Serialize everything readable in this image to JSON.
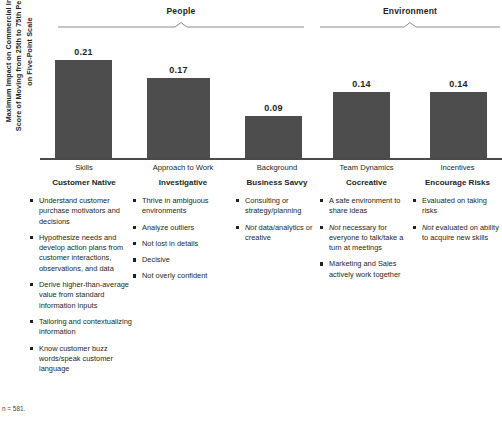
{
  "groups": [
    {
      "label": "People"
    },
    {
      "label": "Environment"
    }
  ],
  "axis": {
    "y_label": "Maximum Impact on Commercial Insight Score of Moving from 25th to 75th Percentile, on Five-Point Scale"
  },
  "chart_data": {
    "type": "bar",
    "title": "",
    "xlabel": "",
    "ylabel": "Maximum Impact on Commercial Insight Score of Moving from 25th to 75th Percentile, on Five-Point Scale",
    "categories": [
      "Skills",
      "Approach to Work",
      "Background",
      "Team Dynamics",
      "Incentives"
    ],
    "values": [
      0.21,
      0.17,
      0.09,
      0.14,
      0.14
    ],
    "value_labels": [
      "0.21",
      "0.17",
      "0.09",
      "0.14",
      "0.14"
    ],
    "ylim": [
      0,
      0.235
    ],
    "grid": false,
    "legend": "none",
    "groups": [
      {
        "name": "People",
        "categories": [
          "Skills",
          "Approach to Work",
          "Background"
        ]
      },
      {
        "name": "Environment",
        "categories": [
          "Team Dynamics",
          "Incentives"
        ]
      }
    ],
    "bar_color": "#4d4d4d",
    "series": [
      {
        "name": "Maximum Impact on Commercial Insight Score",
        "values": [
          0.21,
          0.17,
          0.09,
          0.14,
          0.14
        ]
      }
    ]
  },
  "columns": [
    {
      "sub": "Skills",
      "title": "Customer Native",
      "bullets": [
        [
          {
            "t": "Understand customer purchase motivators and decisions",
            "i": false
          }
        ],
        [
          {
            "t": "Hypothesize needs and develop action plans from customer interactions, observations, and data",
            "i": false
          }
        ],
        [
          {
            "t": "Derive higher-than-average value from standard information inputs",
            "i": false
          }
        ],
        [
          {
            "t": "Tailoring and contextualizing information",
            "i": false
          }
        ],
        [
          {
            "t": "Know customer buzz words/speak customer language",
            "i": false
          }
        ]
      ]
    },
    {
      "sub": "Approach to Work",
      "title": "Investigative",
      "bullets": [
        [
          {
            "t": "Thrive in ambiguous environments",
            "i": false
          }
        ],
        [
          {
            "t": "Analyze outliers",
            "i": false
          }
        ],
        [
          {
            "t": "Not lost in details",
            "i": false
          }
        ],
        [
          {
            "t": "Decisive",
            "i": false
          }
        ],
        [
          {
            "t": "Not overly confident",
            "i": false
          }
        ]
      ]
    },
    {
      "sub": "Background",
      "title": "Business Savvy",
      "bullets": [
        [
          {
            "t": "Consulting or strategy/planning",
            "i": false
          }
        ],
        [
          {
            "t": "Not",
            "i": true
          },
          {
            "t": " data/analytics or creative",
            "i": false
          }
        ]
      ]
    },
    {
      "sub": "Team Dynamics",
      "title": "Cocreative",
      "bullets": [
        [
          {
            "t": "A safe environment to share ideas",
            "i": false
          }
        ],
        [
          {
            "t": "Not",
            "i": true
          },
          {
            "t": " necessary for everyone to talk/take a turn at meetings",
            "i": false
          }
        ],
        [
          {
            "t": "Marketing and Sales actively work together",
            "i": false
          }
        ]
      ]
    },
    {
      "sub": "Incentives",
      "title": "Encourage Risks",
      "bullets": [
        [
          {
            "t": "Evaluated on taking risks",
            "i": false
          }
        ],
        [
          {
            "t": "Not",
            "i": true
          },
          {
            "t": " evaluated on ability to acquire new skills",
            "i": false
          }
        ]
      ]
    }
  ],
  "footnote": {
    "line1": "n = 581.",
    "line2": ""
  }
}
